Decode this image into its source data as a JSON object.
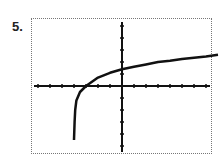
{
  "problem_label": "5.",
  "chart_data": {
    "type": "line",
    "title": "",
    "xlabel": "",
    "ylabel": "",
    "xlim": [
      -7,
      8
    ],
    "ylim": [
      -5,
      5
    ],
    "x_tick_spacing": 1,
    "y_tick_spacing": 1,
    "grid": false,
    "series": [
      {
        "name": "f(x)",
        "x": [
          -4,
          -3.95,
          -3.9,
          -3.8,
          -3.5,
          -3,
          -2,
          -1,
          0,
          1,
          2,
          3,
          4,
          5,
          6,
          7,
          8
        ],
        "y": [
          -4.5,
          -3.0,
          -2.0,
          -1.2,
          -0.5,
          0,
          0.7,
          1.1,
          1.4,
          1.6,
          1.8,
          2.0,
          2.1,
          2.25,
          2.35,
          2.45,
          2.6
        ]
      }
    ]
  },
  "colors": {
    "curve": "#111111",
    "axes": "#111111",
    "frame": "#777777"
  }
}
